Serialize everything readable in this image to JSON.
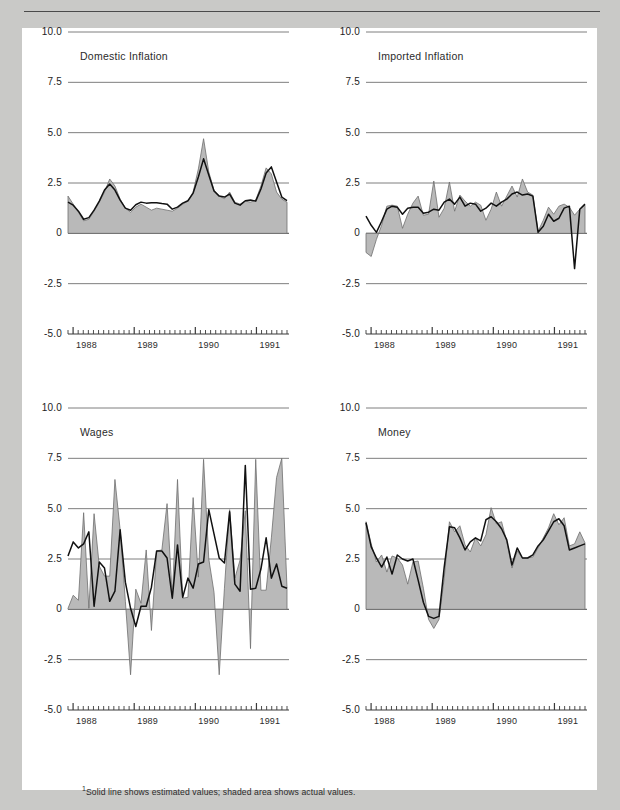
{
  "figure": {
    "caption_partial": "",
    "footnote_marker": "1",
    "footnote": "Solid line shows estimated values; shaded area shows actual values."
  },
  "colors": {
    "page_background": "#c9c9c7",
    "card_background": "#ffffff",
    "shaded_area": "#b9b9b9",
    "shaded_area_stroke": "#6e6e6e",
    "solid_line": "#111111",
    "gridline": "#6f6f6f",
    "axis": "#3a3a3a",
    "text": "#1d1d1d"
  },
  "axes": {
    "ytick_labels": [
      "10.0",
      "7.5",
      "5.0",
      "2.5",
      "0",
      "-2.5",
      "-5.0"
    ],
    "ytick_values": [
      10.0,
      7.5,
      5.0,
      2.5,
      0,
      -2.5,
      -5.0
    ],
    "ylim": [
      -5.0,
      10.0
    ],
    "xtick_labels": [
      "1988",
      "1989",
      "1990",
      "1991"
    ],
    "xlabel": "",
    "grid": true,
    "minor_ticks_per_year": 12
  },
  "chart_data": [
    {
      "type": "area",
      "title": "Domestic Inflation",
      "panel": "top-left",
      "xlabel": "",
      "ylabel": "",
      "ylim": [
        -5.0,
        10.0
      ],
      "ytick_labels": [
        "10.0",
        "7.5",
        "5.0",
        "2.5",
        "0",
        "-2.5",
        "-5.0"
      ],
      "xtick_labels": [
        "1988",
        "1989",
        "1990",
        "1991"
      ],
      "grid": true,
      "legend_position": "none",
      "series": [
        {
          "name": "actual values",
          "render": "shaded area",
          "values": [
            1.85,
            1.45,
            1.05,
            0.62,
            0.7,
            1.1,
            1.55,
            2.05,
            2.7,
            2.35,
            1.7,
            1.25,
            1.05,
            1.3,
            1.45,
            1.3,
            1.15,
            1.25,
            1.2,
            1.15,
            1.1,
            1.25,
            1.45,
            1.6,
            2.05,
            3.2,
            4.7,
            3.05,
            2.15,
            1.85,
            1.72,
            2.05,
            1.55,
            1.45,
            1.6,
            1.55,
            1.65,
            2.35,
            3.25,
            2.95,
            2.05,
            1.7,
            1.55
          ]
        },
        {
          "name": "estimated values",
          "render": "solid line",
          "values": [
            1.55,
            1.4,
            1.1,
            0.7,
            0.78,
            1.15,
            1.6,
            2.15,
            2.45,
            2.15,
            1.65,
            1.25,
            1.15,
            1.42,
            1.55,
            1.5,
            1.52,
            1.52,
            1.48,
            1.45,
            1.2,
            1.3,
            1.5,
            1.62,
            2.0,
            2.8,
            3.7,
            2.9,
            2.1,
            1.85,
            1.8,
            1.95,
            1.5,
            1.4,
            1.62,
            1.65,
            1.6,
            2.2,
            3.0,
            3.3,
            2.55,
            1.8,
            1.62
          ]
        }
      ]
    },
    {
      "type": "area",
      "title": "Imported Inflation",
      "panel": "top-right",
      "xlabel": "",
      "ylabel": "",
      "ylim": [
        -5.0,
        10.0
      ],
      "ytick_labels": [
        "10.0",
        "7.5",
        "5.0",
        "2.5",
        "0",
        "-2.5",
        "-5.0"
      ],
      "xtick_labels": [
        "1988",
        "1989",
        "1990",
        "1991"
      ],
      "grid": true,
      "legend_position": "none",
      "series": [
        {
          "name": "actual values",
          "render": "shaded area",
          "values": [
            -0.95,
            -1.15,
            -0.3,
            0.4,
            1.35,
            1.4,
            1.35,
            0.25,
            0.95,
            1.5,
            1.85,
            0.9,
            0.95,
            2.6,
            0.8,
            1.25,
            2.55,
            1.1,
            1.9,
            1.6,
            1.35,
            1.55,
            1.4,
            0.65,
            1.2,
            2.05,
            1.35,
            1.85,
            2.35,
            1.8,
            2.7,
            2.05,
            1.9,
            0.1,
            0.65,
            1.3,
            0.95,
            1.35,
            1.45,
            1.3,
            0.9,
            1.2,
            1.4
          ]
        },
        {
          "name": "estimated values",
          "render": "solid line",
          "values": [
            0.85,
            0.4,
            0.05,
            0.6,
            1.2,
            1.35,
            1.3,
            0.95,
            1.25,
            1.3,
            1.3,
            1.0,
            1.05,
            1.2,
            1.15,
            1.55,
            1.7,
            1.45,
            1.8,
            1.35,
            1.5,
            1.45,
            1.1,
            1.25,
            1.5,
            1.35,
            1.55,
            1.7,
            1.95,
            2.05,
            1.9,
            1.95,
            1.85,
            0.05,
            0.35,
            0.95,
            0.6,
            0.75,
            1.25,
            1.35,
            -1.75,
            1.2,
            1.45
          ]
        }
      ]
    },
    {
      "type": "area",
      "title": "Wages",
      "panel": "bottom-left",
      "xlabel": "",
      "ylabel": "",
      "ylim": [
        -5.0,
        10.0
      ],
      "ytick_labels": [
        "10.0",
        "7.5",
        "5.0",
        "2.5",
        "0",
        "-2.5",
        "-5.0"
      ],
      "xtick_labels": [
        "1988",
        "1989",
        "1990",
        "1991"
      ],
      "grid": true,
      "legend_position": "none",
      "series": [
        {
          "name": "actual values",
          "render": "shaded area",
          "values": [
            0.05,
            0.7,
            0.45,
            4.8,
            0.05,
            4.75,
            2.15,
            1.65,
            1.65,
            6.45,
            3.95,
            0.4,
            -3.25,
            1.0,
            0.3,
            2.95,
            -1.05,
            2.9,
            2.95,
            5.25,
            0.6,
            6.45,
            0.55,
            0.6,
            5.55,
            1.6,
            7.45,
            2.5,
            0.85,
            -3.25,
            1.05,
            4.95,
            1.55,
            2.45,
            4.9,
            -1.95,
            7.45,
            0.95,
            0.95,
            3.55,
            6.55,
            7.5,
            1.05
          ]
        },
        {
          "name": "estimated values",
          "render": "solid line",
          "values": [
            2.65,
            3.35,
            3.05,
            3.25,
            3.85,
            0.15,
            2.35,
            2.05,
            0.4,
            0.9,
            3.95,
            1.35,
            0.05,
            -0.85,
            0.15,
            0.15,
            1.1,
            2.9,
            2.9,
            2.55,
            0.55,
            3.2,
            0.6,
            1.55,
            1.05,
            2.25,
            2.35,
            4.95,
            3.75,
            2.55,
            2.3,
            4.85,
            1.25,
            0.9,
            7.15,
            1.0,
            1.05,
            2.0,
            3.55,
            1.55,
            2.25,
            1.15,
            1.05
          ]
        }
      ]
    },
    {
      "type": "area",
      "title": "Money",
      "panel": "bottom-right",
      "xlabel": "",
      "ylabel": "",
      "ylim": [
        -5.0,
        10.0
      ],
      "ytick_labels": [
        "10.0",
        "7.5",
        "5.0",
        "2.5",
        "0",
        "-2.5",
        "-5.0"
      ],
      "xtick_labels": [
        "1988",
        "1989",
        "1990",
        "1991"
      ],
      "grid": true,
      "legend_position": "none",
      "series": [
        {
          "name": "actual values",
          "render": "shaded area",
          "values": [
            4.35,
            3.25,
            2.35,
            2.7,
            1.85,
            2.65,
            2.55,
            2.2,
            1.25,
            2.35,
            2.4,
            1.05,
            -0.5,
            -0.95,
            -0.5,
            1.55,
            4.35,
            3.85,
            4.15,
            3.2,
            2.85,
            3.55,
            3.15,
            3.7,
            5.05,
            4.25,
            4.35,
            3.35,
            2.05,
            2.9,
            2.55,
            2.55,
            2.6,
            3.05,
            3.55,
            4.05,
            4.75,
            4.2,
            4.55,
            3.15,
            3.25,
            3.85,
            3.3
          ]
        },
        {
          "name": "estimated values",
          "render": "solid line",
          "values": [
            4.3,
            3.1,
            2.55,
            2.1,
            2.6,
            1.75,
            2.7,
            2.5,
            2.4,
            2.5,
            1.45,
            0.35,
            -0.35,
            -0.45,
            -0.35,
            2.1,
            4.1,
            4.05,
            3.55,
            2.95,
            3.35,
            3.55,
            3.4,
            4.45,
            4.6,
            4.35,
            4.0,
            3.45,
            2.2,
            3.05,
            2.55,
            2.55,
            2.7,
            3.15,
            3.45,
            3.9,
            4.35,
            4.5,
            4.15,
            2.95,
            3.05,
            3.15,
            3.25
          ]
        }
      ]
    }
  ]
}
